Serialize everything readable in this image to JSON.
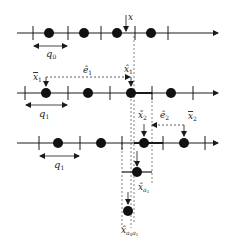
{
  "diagram": {
    "type": "quantization-lattice-diagram",
    "colors": {
      "ink": "#1a1a1a",
      "dot": "#111111",
      "dash": "#555555"
    },
    "rows": [
      {
        "id": "row0",
        "y": 33,
        "ticks": [
          33,
          68,
          101,
          135,
          168
        ],
        "dots": [
          49,
          84,
          117,
          151
        ],
        "step_label": "q0",
        "step_sub": "0"
      },
      {
        "id": "row1",
        "y": 93,
        "ticks": [
          25,
          68,
          110,
          152,
          193
        ],
        "dots": [
          46,
          88,
          131,
          171
        ],
        "step_label": "q1",
        "step_sub": "1"
      },
      {
        "id": "row2",
        "y": 143,
        "ticks": [
          39,
          80,
          122,
          163,
          205
        ],
        "dots": [
          58,
          101,
          144,
          184
        ],
        "step_label": "q1",
        "step_sub": "1"
      }
    ],
    "labels": {
      "x": "x",
      "x_bar_1": "x̄",
      "x_bar_1_sub": "1",
      "e_hat_1": "ê",
      "e_hat_1_sub": "1",
      "x_hat_1": "x̂",
      "x_hat_1_sub": "1",
      "x_tilde_2": "x̃",
      "x_tilde_2_sub": "2",
      "e_hat_2": "ê",
      "e_hat_2_sub": "2",
      "x_bar_2": "x̄",
      "x_bar_2_sub": "2",
      "x_hat_a1": "x̂",
      "x_hat_a1_sub": "a",
      "x_hat_a1_subsub": "1",
      "x_hat_a0a1": "x̂",
      "x_hat_a0a1_sub": "a",
      "x_hat_a0a1_subsub0": "0",
      "x_hat_a0a1_subsub1": "1",
      "q0": "q",
      "q0_sub": "0",
      "q1": "q",
      "q1_sub": "1",
      "q1b": "q",
      "q1b_sub": "1"
    }
  }
}
